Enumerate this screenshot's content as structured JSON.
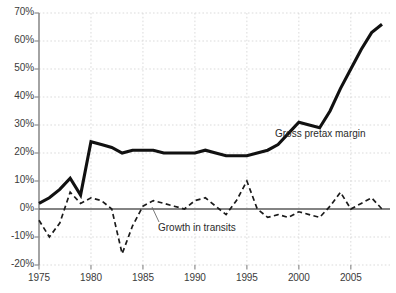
{
  "chart_data": {
    "type": "line",
    "title": "",
    "subtitle": "",
    "xlabel": "",
    "ylabel": "",
    "xlim": [
      1975,
      2008
    ],
    "ylim": [
      -20,
      70
    ],
    "ytick_step": 10,
    "grid": true,
    "legend_position": "inline-annotation",
    "y_ticks": [
      "70%",
      "60%",
      "50%",
      "40%",
      "30%",
      "20%",
      "10%",
      "0%",
      "-10%",
      "-20%"
    ],
    "y_tick_values": [
      70,
      60,
      50,
      40,
      30,
      20,
      10,
      0,
      -10,
      -20
    ],
    "x_ticks": [
      "1975",
      "1980",
      "1985",
      "1990",
      "1995",
      "2000",
      "2005"
    ],
    "x_tick_values": [
      1975,
      1980,
      1985,
      1990,
      1995,
      2000,
      2005
    ],
    "x": [
      1975,
      1976,
      1977,
      1978,
      1979,
      1980,
      1981,
      1982,
      1983,
      1984,
      1985,
      1986,
      1987,
      1988,
      1989,
      1990,
      1991,
      1992,
      1993,
      1994,
      1995,
      1996,
      1997,
      1998,
      1999,
      2000,
      2001,
      2002,
      2003,
      2004,
      2005,
      2006,
      2007,
      2008
    ],
    "series": [
      {
        "name": "Gross pretax margin",
        "style": "solid",
        "color": "#111111",
        "width": 3,
        "label_x": 2000,
        "label_y": 28,
        "values": [
          2,
          4,
          7,
          11,
          5,
          24,
          23,
          22,
          20,
          21,
          21,
          21,
          20,
          20,
          20,
          20,
          21,
          20,
          19,
          19,
          19,
          20,
          21,
          23,
          27,
          31,
          30,
          29,
          35,
          43,
          50,
          57,
          63,
          66
        ]
      },
      {
        "name": "Growth in transits",
        "style": "dashed",
        "color": "#1a1a1a",
        "width": 1.6,
        "label_x": 1986,
        "label_y": -8,
        "values": [
          -4,
          -10,
          -5,
          6,
          2,
          4,
          3,
          0,
          -16,
          -6,
          1,
          3,
          2,
          1,
          0,
          3,
          4,
          1,
          -2,
          3,
          10,
          0,
          -3,
          -2,
          -3,
          -1,
          -2,
          -3,
          1,
          6,
          0,
          2,
          4,
          0
        ]
      }
    ],
    "annotations": [
      {
        "text": "Gross pretax margin",
        "anchor_x": 2000,
        "anchor_y": 28
      },
      {
        "text": "Growth in transits",
        "anchor_x": 1986,
        "anchor_y": -8
      }
    ],
    "colors": {
      "background": "#ffffff",
      "grid": "#d7d7d7",
      "axis": "#8d8d8d",
      "zero_line": "#5a5a5a",
      "tick_text": "#3b3b3b",
      "margin_series": "#111111",
      "growth_series": "#1a1a1a"
    }
  },
  "labels": {
    "margin_label": "Gross pretax margin",
    "growth_label": "Growth in transits"
  }
}
